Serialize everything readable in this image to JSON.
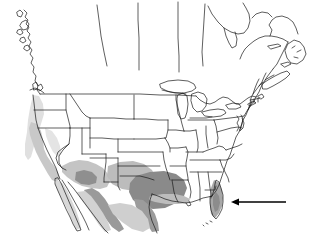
{
  "figure": {
    "type": "distribution-range-map",
    "region": "North America",
    "background_color": "#ffffff",
    "outline_color": "#1a1a1a",
    "title": "",
    "caption": ""
  },
  "legend": {
    "shading_classes": [
      {
        "name": "core-range",
        "color": "#8c8c8c",
        "label": ""
      },
      {
        "name": "peripheral-range",
        "color": "#bdbdbd",
        "label": ""
      },
      {
        "name": "marginal-range",
        "color": "#d9d9d9",
        "label": ""
      }
    ]
  },
  "annotations": {
    "pointer": {
      "name": "arrow-annotation",
      "label": "",
      "direction": "left",
      "target": "southern Florida",
      "color": "#000000",
      "tail_x": 286,
      "head_x": 231,
      "y": 202
    }
  },
  "shaded_areas": [
    {
      "name": "pacific-coast-strip",
      "class": "marginal-range"
    },
    {
      "name": "california-coast",
      "class": "peripheral-range"
    },
    {
      "name": "southwest-arizona-new-mexico",
      "class": "peripheral-range"
    },
    {
      "name": "west-texas",
      "class": "peripheral-range"
    },
    {
      "name": "south-texas",
      "class": "core-range"
    },
    {
      "name": "gulf-coast",
      "class": "peripheral-range"
    },
    {
      "name": "sierra-madre-occidental",
      "class": "core-range"
    },
    {
      "name": "sierra-madre-oriental",
      "class": "core-range"
    },
    {
      "name": "baja-california",
      "class": "marginal-range"
    },
    {
      "name": "florida-peninsula",
      "class": "peripheral-range"
    }
  ],
  "map_features": {
    "country_outlines": [
      "United States",
      "Canada",
      "Mexico"
    ],
    "state_boundaries_shown": true,
    "great_lakes_shown": true,
    "scale_bar": "",
    "north_arrow": ""
  }
}
